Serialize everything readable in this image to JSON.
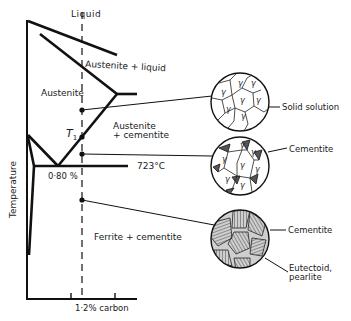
{
  "diagram": {
    "regions": {
      "liquid": "Liquid",
      "austenite_liquid": "Austenite + liquid",
      "austenite": "Austenite",
      "austenite_cementite_line1": "Austenite",
      "austenite_cementite_line2": "+ cementite",
      "ferrite_cementite": "Ferrite + cementite"
    },
    "annotations": {
      "t1": "T",
      "t1_sub": "1",
      "eutectoid_comp": "0·80 %",
      "eutectoid_temp": "723°C",
      "composition": "1·2% carbon"
    },
    "axis": {
      "ylabel": "Temperature"
    },
    "micrographs": [
      {
        "id": "austenite-grains",
        "labels": [
          "Solid solution"
        ],
        "grain_symbol": "γ"
      },
      {
        "id": "austenite-cementite",
        "labels": [
          "Cementite"
        ],
        "grain_symbol": "γ"
      },
      {
        "id": "pearlite",
        "labels": [
          "Cementite",
          "Eutectoid,",
          "pearlite"
        ]
      }
    ]
  }
}
